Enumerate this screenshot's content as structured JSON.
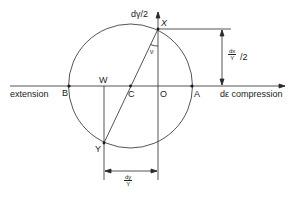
{
  "diagram": {
    "type": "mohr-circle-strain-increment",
    "labels": {
      "y_axis": "dγ/2",
      "x_axis": "dε compression",
      "extension": "extension",
      "point_X": "X",
      "point_Y": "Y",
      "point_W": "W",
      "point_B": "B",
      "point_C": "C",
      "point_O": "O",
      "point_A": "A",
      "angle": "ν"
    },
    "dimensions": {
      "right_num": "dx",
      "right_den": "Y",
      "right_suffix": "/2",
      "bottom_num": "dy",
      "bottom_den": "Y"
    },
    "colors": {
      "line": "#2a2a2a",
      "background": "#ffffff"
    }
  }
}
